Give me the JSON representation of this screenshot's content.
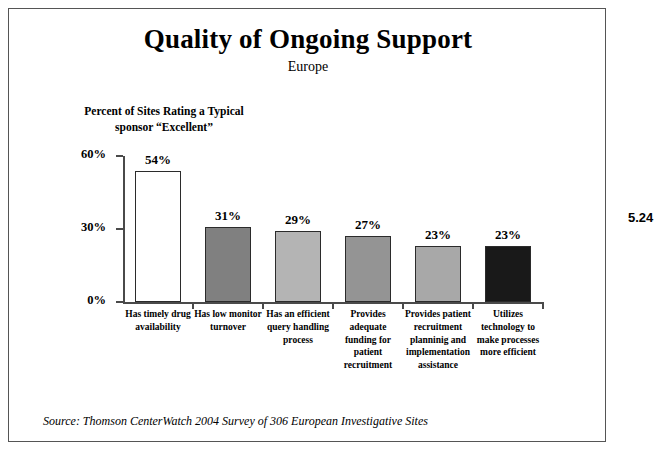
{
  "figure_number": "5.24",
  "source_note": "Source:  Thomson CenterWatch 2004 Survey of 306 European Investigative Sites",
  "chart_data": {
    "type": "bar",
    "title": "Quality of Ongoing Support",
    "subtitle": "Europe",
    "ylabel": "Percent of Sites Rating a Typical sponsor “Excellent”",
    "ylabel_line1": "Percent of Sites Rating a Typical",
    "ylabel_line2": "sponsor “Excellent”",
    "xlabel": "",
    "ylim": [
      0,
      60
    ],
    "yticks": [
      0,
      30,
      60
    ],
    "ytick_labels": [
      "0%",
      "30%",
      "60%"
    ],
    "grid": false,
    "legend": false,
    "categories": [
      "Has timely drug availability",
      "Has low monitor turnover",
      "Has an efficient query handling process",
      "Provides adequate funding for patient recruitment",
      "Provides patient recruitment planninig and implementation assistance",
      "Utilizes technology to make processes more efficient"
    ],
    "category_lines": [
      [
        "Has timely drug",
        "availability"
      ],
      [
        "Has low monitor",
        "turnover"
      ],
      [
        "Has an efficient",
        "query handling",
        "process"
      ],
      [
        "Provides",
        "adequate",
        "funding for",
        "patient",
        "recruitment"
      ],
      [
        "Provides patient",
        "recruitment",
        "planninig and",
        "implementation",
        "assistance"
      ],
      [
        "Utilizes",
        "technology to",
        "make processes",
        "more efficient"
      ]
    ],
    "values": [
      54,
      31,
      29,
      27,
      23,
      23
    ],
    "value_labels": [
      "54%",
      "31%",
      "29%",
      "27%",
      "23%",
      "23%"
    ],
    "bar_colors": [
      "#ffffff",
      "#808080",
      "#b4b4b4",
      "#949494",
      "#a8a8a8",
      "#191919"
    ],
    "bar_edge_color": "#2b2b2b",
    "axis_color": "#4a4a4a"
  }
}
